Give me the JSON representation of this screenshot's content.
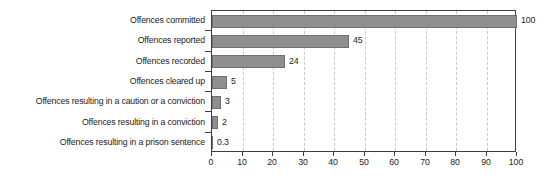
{
  "chart_data": {
    "type": "bar",
    "orientation": "horizontal",
    "title": "",
    "subtitle": "",
    "xlabel": "",
    "ylabel": "",
    "xlim": [
      0,
      100
    ],
    "xticks": [
      0,
      10,
      20,
      30,
      40,
      50,
      60,
      70,
      80,
      90,
      100
    ],
    "xtick_labels": [
      "0",
      "10",
      "20",
      "30",
      "40",
      "50",
      "60",
      "70",
      "80",
      "90",
      "100"
    ],
    "grid": true,
    "grid_axis": "x",
    "grid_style": "dashed",
    "legend": false,
    "legend_position": "none",
    "bar_color": "#8f8f8f",
    "bar_edge_color": "#707070",
    "axis_color": "#3d3d3d",
    "gridline_color": "#c9c9c9",
    "text_color": "#1c1c1c",
    "background_color": "#ffffff",
    "categories": [
      "Offences committed",
      "Offences reported",
      "Offences recorded",
      "Offences cleared up",
      "Offences resulting in a caution or a conviction",
      "Offences resulting in a conviction",
      "Offences resulting in a prison sentence"
    ],
    "values": [
      100,
      45,
      24,
      5,
      3,
      2,
      0.3
    ],
    "data_labels": [
      "100",
      "45",
      "24",
      "5",
      "3",
      "2",
      "0.3"
    ],
    "series": [
      {
        "name": "Attrition",
        "values": [
          100,
          45,
          24,
          5,
          3,
          2,
          0.3
        ]
      }
    ]
  }
}
